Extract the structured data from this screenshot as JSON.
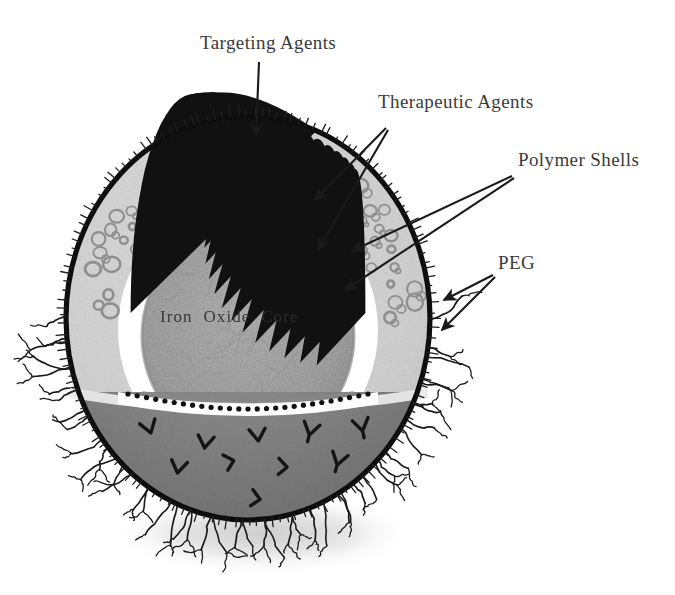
{
  "figure": {
    "background_color": "#ffffff"
  },
  "labels": {
    "targeting_agents": "Targeting Agents",
    "therapeutic_agents": "Therapeutic Agents",
    "polymer_shells": "Polymer Shells",
    "peg": "PEG",
    "iron_oxide_core": "Iron  Oxide  Core"
  },
  "colors": {
    "outer_membrane": "#111111",
    "upper_polymer_shell": "#d3d3d3",
    "lower_hemisphere": "#8a8a8a",
    "core_fill": "#a8a8a8",
    "core_rim": "#8f8f8f",
    "white_gap": "#ffffff",
    "charge_marker": "#111111",
    "drug_ring": "#909090",
    "peg_hair": "#1b1b1b",
    "label_text": "#3a3a3a",
    "shadow": "#d8d8d8",
    "arrow": "#1a1a1a"
  },
  "structure": {
    "layers": [
      {
        "name": "peg-corona",
        "description": "branched hair-like chains radiating from the outer membrane"
      },
      {
        "name": "outer-membrane",
        "description": "thick dark outer boundary of the nanoparticle"
      },
      {
        "name": "polymer-shell",
        "description": "light gray shell containing ring-shaped therapeutic agent molecules"
      },
      {
        "name": "white-gap",
        "description": "white interstitial band carrying positive charge markers"
      },
      {
        "name": "iron-oxide-core",
        "description": "mottled gray magnetic core at the center"
      },
      {
        "name": "lower-hemisphere",
        "description": "mid-gray uncut lower half bearing targeting agent glyphs"
      }
    ],
    "sphere": {
      "cx": 248,
      "cy": 318,
      "rx": 182,
      "ry": 202
    },
    "marker_counts": {
      "charge_plus": 23,
      "charge_dots": 27,
      "drug_rings": 58,
      "targeting_glyphs": 17,
      "peg_hairs": 46
    }
  },
  "annotations": [
    {
      "id": "targeting-agents",
      "label": "Targeting Agents",
      "text_x": 200,
      "text_y": 49,
      "arrows": 1
    },
    {
      "id": "therapeutic-agents",
      "label": "Therapeutic Agents",
      "text_x": 378,
      "text_y": 108,
      "arrows": 2
    },
    {
      "id": "polymer-shells",
      "label": "Polymer Shells",
      "text_x": 518,
      "text_y": 166,
      "arrows": 2
    },
    {
      "id": "peg",
      "label": "PEG",
      "text_x": 498,
      "text_y": 269,
      "arrows": 2
    }
  ]
}
